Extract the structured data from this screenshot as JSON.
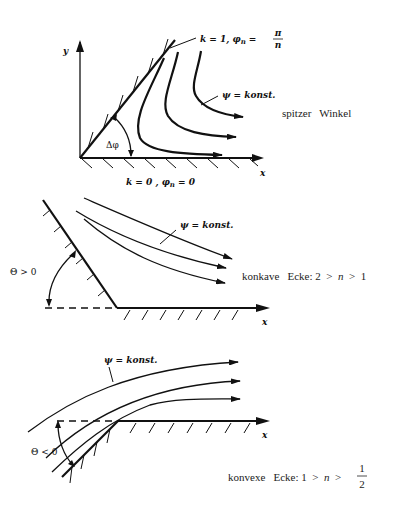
{
  "figures": [
    {
      "id": "sharp-angle",
      "axis_y_label": "y",
      "axis_x_label": "x",
      "wall_label_top": "k = 1, φn = π/n",
      "wall_label_top_prefix": "k = 1, φ",
      "wall_label_top_sub": "n",
      "wall_label_top_eq": "=",
      "wall_label_top_num": "π",
      "wall_label_top_den": "n",
      "wall_label_bottom": "k = 0 , φn = 0",
      "wall_label_bottom_a": "k = 0 , φ",
      "wall_label_bottom_sub": "n",
      "wall_label_bottom_b": " = 0",
      "angle_label": "Δφ",
      "streamline_label": "ψ = konst.",
      "caption": "spitzer   Winkel"
    },
    {
      "id": "concave-corner",
      "axis_x_label": "x",
      "angle_label": "Θ > 0",
      "streamline_label": "ψ = konst.",
      "caption_a": "konkave   Ecke: 2  >  ",
      "caption_n": "n",
      "caption_b": "  >  1"
    },
    {
      "id": "convex-corner",
      "axis_x_label": "x",
      "angle_label": "Θ < 0",
      "streamline_label": "ψ = konst.",
      "caption_a": "konvexe   Ecke: 1  >  ",
      "caption_n": "n",
      "caption_b": "  >",
      "caption_frac_num": "1",
      "caption_frac_den": "2"
    }
  ]
}
